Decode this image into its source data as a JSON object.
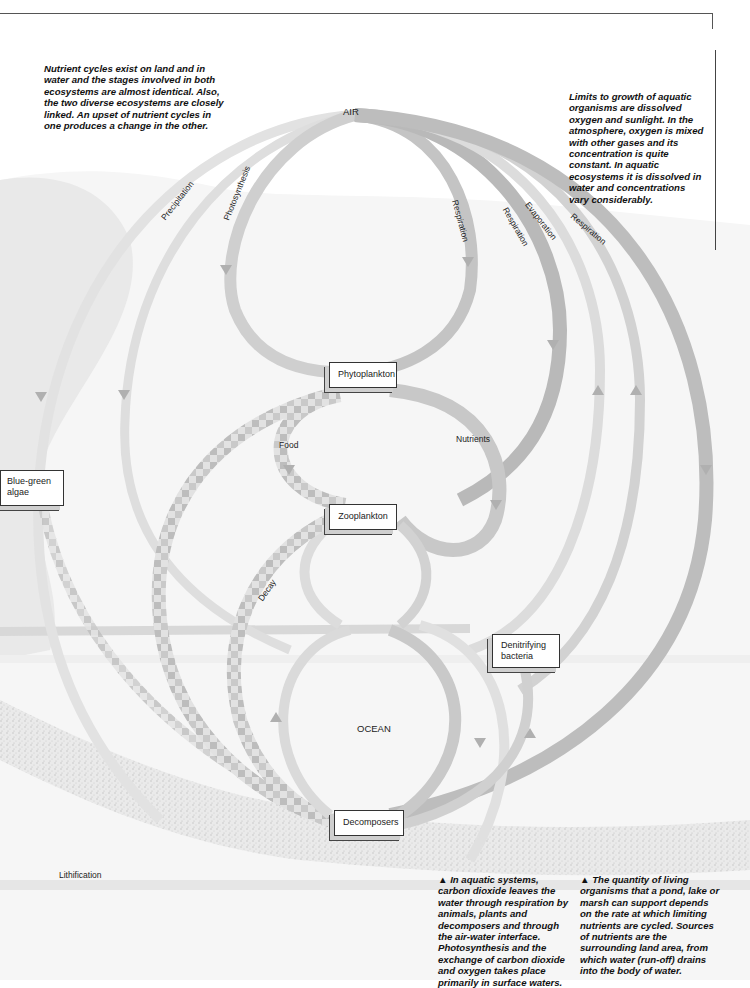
{
  "page": {
    "page_number_hint": ""
  },
  "captions": {
    "left": "Nutrient cycles exist on land and in water and the stages involved in both ecosystems are almost identical. Also, the two diverse ecosystems are closely linked. An upset of nutrient cycles in one produces a change in the other.",
    "right": "Limits to growth of aquatic organisms are dissolved oxygen and sunlight. In the atmosphere, oxygen is mixed with other gases and its concentration is quite constant. In aquatic ecosystems it is dissolved in water and concentrations vary considerably.",
    "bottom_middle": "▲ In aquatic systems, carbon dioxide leaves the water through respiration by animals, plants and decomposers and through the air-water interface. Photosynthesis and the exchange of carbon dioxide and oxygen takes place primarily in surface waters.",
    "bottom_right": "▲ The quantity of living organisms that a pond, lake or marsh can support depends on the rate at which limiting nutrients are cycled. Sources of nutrients are the surrounding land area, from which water (run-off) drains into the body of water."
  },
  "diagram": {
    "regions": {
      "air": "AIR",
      "ocean": "OCEAN"
    },
    "nodes": {
      "phytoplankton": "Phytoplankton",
      "zooplankton": "Zooplankton",
      "blue_green_algae": "Blue-green algae",
      "denitrifying_bacteria": "Denitrifying bacteria",
      "decomposers": "Decomposers"
    },
    "flows": {
      "precipitation": "Precipitation",
      "photosynthesis": "Photosynthesis",
      "respiration_1": "Respiration",
      "respiration_2": "Respiration",
      "evaporation": "Evaporation",
      "respiration_3": "Respiration",
      "food": "Food",
      "nutrients": "Nutrients",
      "decay": "Decay",
      "lithification": "Lithification"
    },
    "colors": {
      "band_light": "#e4e4e4",
      "band_mid": "#c8c8c8",
      "band_dark": "#a8a8a8",
      "background_wash": "#ececec",
      "sediment": "#d6d6d6"
    }
  }
}
